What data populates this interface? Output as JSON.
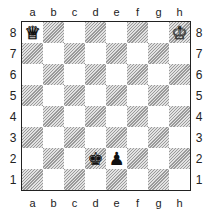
{
  "board": {
    "files": [
      "a",
      "b",
      "c",
      "d",
      "e",
      "f",
      "g",
      "h"
    ],
    "ranks": [
      "8",
      "7",
      "6",
      "5",
      "4",
      "3",
      "2",
      "1"
    ],
    "light_color": "#ffffff",
    "dark_color": "#9a9a9a",
    "pieces": {
      "a8": {
        "name": "white-queen",
        "glyph": "♕",
        "color": "white"
      },
      "h8": {
        "name": "white-king",
        "glyph": "♔",
        "color": "white"
      },
      "d2": {
        "name": "black-king",
        "glyph": "♚",
        "color": "black"
      },
      "e2": {
        "name": "black-pawn",
        "glyph": "♟",
        "color": "black"
      }
    }
  }
}
